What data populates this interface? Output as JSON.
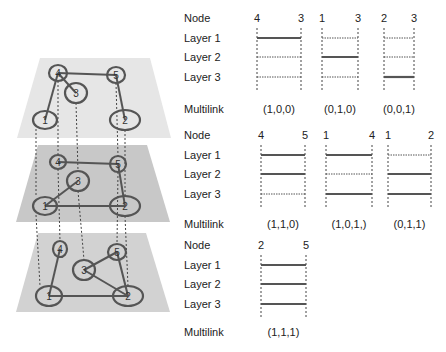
{
  "diagram": {
    "layers": [
      {
        "name": "Layer 1",
        "fill": "#e6e6e6",
        "nodes": [
          {
            "id": "4",
            "x": 58,
            "y": 73,
            "rx": 9,
            "ry": 8
          },
          {
            "id": "5",
            "x": 116,
            "y": 75,
            "rx": 9,
            "ry": 8
          },
          {
            "id": "3",
            "x": 76,
            "y": 93,
            "rx": 11,
            "ry": 10
          },
          {
            "id": "1",
            "x": 45,
            "y": 120,
            "rx": 12,
            "ry": 9
          },
          {
            "id": "2",
            "x": 125,
            "y": 120,
            "rx": 15,
            "ry": 10
          }
        ],
        "edges": [
          [
            "4",
            "5"
          ],
          [
            "4",
            "3"
          ],
          [
            "4",
            "1"
          ],
          [
            "5",
            "2"
          ]
        ]
      },
      {
        "name": "Layer 2",
        "fill": "#c8c8c8",
        "nodes": [
          {
            "id": "4",
            "x": 58,
            "y": 162,
            "rx": 8,
            "ry": 7
          },
          {
            "id": "5",
            "x": 118,
            "y": 164,
            "rx": 8,
            "ry": 8
          },
          {
            "id": "3",
            "x": 78,
            "y": 181,
            "rx": 11,
            "ry": 10
          },
          {
            "id": "1",
            "x": 45,
            "y": 206,
            "rx": 12,
            "ry": 9
          },
          {
            "id": "2",
            "x": 125,
            "y": 206,
            "rx": 15,
            "ry": 10
          }
        ],
        "edges": [
          [
            "4",
            "5"
          ],
          [
            "1",
            "3"
          ],
          [
            "1",
            "2"
          ],
          [
            "5",
            "2"
          ]
        ]
      },
      {
        "name": "Layer 3",
        "fill": "#d2d2d2",
        "nodes": [
          {
            "id": "4",
            "x": 60,
            "y": 249,
            "rx": 7,
            "ry": 8
          },
          {
            "id": "5",
            "x": 117,
            "y": 252,
            "rx": 9,
            "ry": 8
          },
          {
            "id": "3",
            "x": 84,
            "y": 270,
            "rx": 11,
            "ry": 10
          },
          {
            "id": "1",
            "x": 49,
            "y": 296,
            "rx": 13,
            "ry": 10
          },
          {
            "id": "2",
            "x": 128,
            "y": 296,
            "rx": 15,
            "ry": 10
          }
        ],
        "edges": [
          [
            "4",
            "1"
          ],
          [
            "1",
            "2"
          ],
          [
            "3",
            "5"
          ],
          [
            "3",
            "2"
          ],
          [
            "5",
            "2"
          ]
        ]
      }
    ],
    "row_labels": {
      "node": "Node",
      "layer1": "Layer 1",
      "layer2": "Layer 2",
      "layer3": "Layer 3",
      "multilink": "Multilink"
    },
    "blocks": [
      {
        "pair": [
          "4",
          "3"
        ],
        "layers": [
          1,
          0,
          0
        ],
        "label": "(1,0,0)"
      },
      {
        "pair": [
          "1",
          "3"
        ],
        "layers": [
          0,
          1,
          0
        ],
        "label": "(0,1,0)"
      },
      {
        "pair": [
          "2",
          "3"
        ],
        "layers": [
          0,
          0,
          1
        ],
        "label": "(0,0,1)"
      },
      {
        "pair": [
          "4",
          "5"
        ],
        "layers": [
          1,
          1,
          0
        ],
        "label": "(1,1,0)"
      },
      {
        "pair": [
          "1",
          "4"
        ],
        "layers": [
          1,
          0,
          1
        ],
        "label": "(1,0,1,)"
      },
      {
        "pair": [
          "1",
          "2"
        ],
        "layers": [
          0,
          1,
          1
        ],
        "label": "(0,1,1)"
      },
      {
        "pair": [
          "2",
          "5"
        ],
        "layers": [
          1,
          1,
          1
        ],
        "label": "(1,1,1)"
      }
    ]
  }
}
